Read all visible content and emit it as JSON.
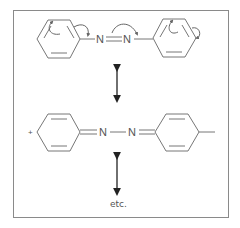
{
  "diagram": {
    "type": "resonance-structures",
    "structure_1": {
      "description": "azobenzene with curved electron-pushing arrows",
      "atoms": [
        "N",
        "N"
      ],
      "bond": "N=N"
    },
    "structure_2": {
      "description": "quinoid resonance form",
      "charge": "+",
      "atoms": [
        "N",
        "N"
      ],
      "bond": "N-N"
    },
    "resonance_arrow": "double-headed",
    "footer": "etc.",
    "colors": {
      "line": "#777777",
      "frame": "#8a8a8a",
      "text": "#555555"
    }
  }
}
